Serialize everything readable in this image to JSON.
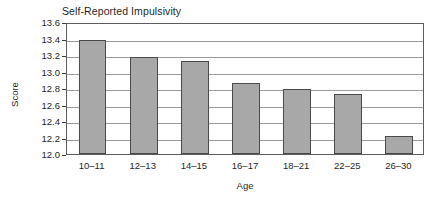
{
  "chart_data": {
    "type": "bar",
    "title": "Self-Reported Impulsivity",
    "xlabel": "Age",
    "ylabel": "Score",
    "categories": [
      "10–11",
      "12–13",
      "14–15",
      "16–17",
      "18–21",
      "22–25",
      "26–30"
    ],
    "values": [
      13.38,
      13.17,
      13.13,
      12.86,
      12.79,
      12.73,
      12.22
    ],
    "ylim": [
      12.0,
      13.6
    ],
    "ytick_step": 0.2,
    "ytick_labels": [
      "12.0",
      "12.2",
      "12.4",
      "12.6",
      "12.8",
      "13.0",
      "13.2",
      "13.4",
      "13.6"
    ],
    "ytick_values": [
      12.0,
      12.2,
      12.4,
      12.6,
      12.8,
      13.0,
      13.2,
      13.4,
      13.6
    ],
    "grid": true,
    "grid_axis": "y",
    "legend": false,
    "legend_position": "none",
    "bar_color": "#a8a8a8",
    "bar_edge_color": "#4a4a4a",
    "grid_color": "#9a9a9a",
    "axis_color": "#5c5c5c",
    "background_color": "#ffffff",
    "text_color": "#1f1f1f",
    "title_align": "left"
  }
}
